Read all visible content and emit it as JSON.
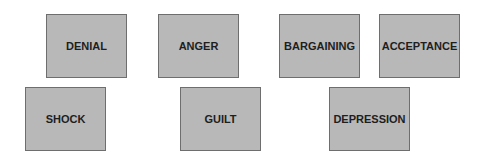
{
  "diagram": {
    "box_color": "#b8b8b8",
    "border_color": "#6e6e6e",
    "text_color": "#1e1e1e",
    "stages": [
      {
        "label": "DENIAL",
        "row": 1,
        "x": 46,
        "y": 14
      },
      {
        "label": "ANGER",
        "row": 1,
        "x": 158,
        "y": 14
      },
      {
        "label": "BARGAINING",
        "row": 1,
        "x": 279,
        "y": 14
      },
      {
        "label": "ACCEPTANCE",
        "row": 1,
        "x": 379,
        "y": 14
      },
      {
        "label": "SHOCK",
        "row": 2,
        "x": 25,
        "y": 87
      },
      {
        "label": "GUILT",
        "row": 2,
        "x": 180,
        "y": 87
      },
      {
        "label": "DEPRESSION",
        "row": 2,
        "x": 329,
        "y": 87
      }
    ]
  }
}
